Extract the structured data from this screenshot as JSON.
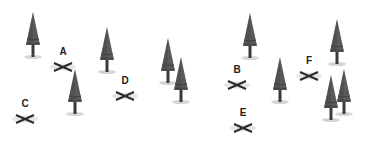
{
  "scene": {
    "colors": {
      "background": "#ffffff",
      "tree_foliage": "#5a5a5a",
      "tree_foliage_dark": "#3f3f3f",
      "tree_trunk": "#3a3a3a",
      "shadow": "#d6d6d6",
      "marker": "#2a2a2a",
      "label": "#222222"
    },
    "markers": [
      {
        "label": "A",
        "x": 63,
        "y": 65
      },
      {
        "label": "B",
        "x": 237,
        "y": 83
      },
      {
        "label": "C",
        "x": 25,
        "y": 117
      },
      {
        "label": "D",
        "x": 125,
        "y": 94
      },
      {
        "label": "E",
        "x": 243,
        "y": 126
      },
      {
        "label": "F",
        "x": 309,
        "y": 74
      }
    ],
    "trees": [
      {
        "x": 33,
        "base": 58
      },
      {
        "x": 107,
        "base": 73
      },
      {
        "x": 168,
        "base": 84
      },
      {
        "x": 181,
        "base": 103
      },
      {
        "x": 75,
        "base": 115
      },
      {
        "x": 250,
        "base": 59
      },
      {
        "x": 280,
        "base": 103
      },
      {
        "x": 337,
        "base": 65
      },
      {
        "x": 344,
        "base": 115
      },
      {
        "x": 331,
        "base": 121
      }
    ]
  }
}
